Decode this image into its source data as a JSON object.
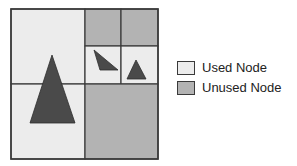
{
  "colors": {
    "used": "#ececec",
    "unused": "#b3b3b3",
    "line": "#3a3a3a",
    "shape": "#4a4a4a"
  },
  "diagram": {
    "cells": [
      {
        "id": "top-left",
        "x": 11,
        "y": 9,
        "w": 74,
        "h": 75,
        "state": "used"
      },
      {
        "id": "bottom-left",
        "x": 11,
        "y": 84,
        "w": 74,
        "h": 75,
        "state": "used"
      },
      {
        "id": "top-right-nw",
        "x": 85,
        "y": 9,
        "w": 36,
        "h": 37,
        "state": "unused"
      },
      {
        "id": "top-right-ne",
        "x": 121,
        "y": 9,
        "w": 37,
        "h": 37,
        "state": "unused"
      },
      {
        "id": "top-right-sw",
        "x": 85,
        "y": 46,
        "w": 36,
        "h": 38,
        "state": "used"
      },
      {
        "id": "top-right-se",
        "x": 121,
        "y": 46,
        "w": 37,
        "h": 38,
        "state": "used"
      },
      {
        "id": "bottom-right",
        "x": 85,
        "y": 84,
        "w": 73,
        "h": 75,
        "state": "unused"
      }
    ],
    "triangles": [
      {
        "id": "large-triangle",
        "points": "52,55 75,123 30,123"
      },
      {
        "id": "small-triangle-left",
        "points": "94,50 118,70 100,70"
      },
      {
        "id": "small-triangle-right",
        "points": "136,60 146,79 127,79"
      }
    ]
  },
  "legend": {
    "items": [
      {
        "label": "Used Node",
        "state": "used"
      },
      {
        "label": "Unused Node",
        "state": "unused"
      }
    ]
  }
}
